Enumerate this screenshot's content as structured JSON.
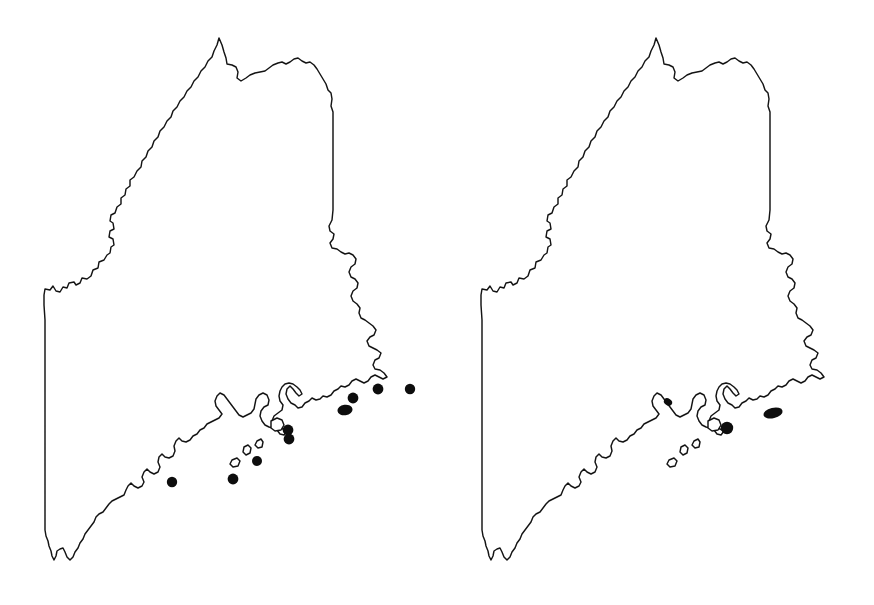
{
  "figure": {
    "panel_count": 2,
    "background_color": "#ffffff",
    "outline_color": "#141414",
    "dot_color": "#0d0d0d",
    "canvas": {
      "width": 874,
      "height": 605
    }
  },
  "panels": [
    {
      "id": "left",
      "name": "left-distribution-map",
      "region_label": "Maine",
      "origin_x": 0,
      "dot_count": 9,
      "dots": [
        {
          "label": "dot-1",
          "cx": 172,
          "cy": 482,
          "rx": 5.2,
          "ry": 5.2,
          "rot": 0
        },
        {
          "label": "dot-2",
          "cx": 233,
          "cy": 479,
          "rx": 5.4,
          "ry": 5.4,
          "rot": 0
        },
        {
          "label": "dot-3",
          "cx": 257,
          "cy": 461,
          "rx": 5.0,
          "ry": 5.0,
          "rot": 0
        },
        {
          "label": "dot-4",
          "cx": 288,
          "cy": 430,
          "rx": 5.4,
          "ry": 5.4,
          "rot": 0
        },
        {
          "label": "dot-5",
          "cx": 289,
          "cy": 439,
          "rx": 5.4,
          "ry": 5.4,
          "rot": 0
        },
        {
          "label": "dot-6",
          "cx": 345,
          "cy": 410,
          "rx": 7.6,
          "ry": 5.2,
          "rot": -8
        },
        {
          "label": "dot-7",
          "cx": 353,
          "cy": 398,
          "rx": 5.4,
          "ry": 5.4,
          "rot": 0
        },
        {
          "label": "dot-8",
          "cx": 378,
          "cy": 389,
          "rx": 5.4,
          "ry": 5.4,
          "rot": 0
        },
        {
          "label": "dot-9",
          "cx": 410,
          "cy": 389,
          "rx": 5.2,
          "ry": 5.2,
          "rot": 0
        }
      ]
    },
    {
      "id": "right",
      "name": "right-distribution-map",
      "region_label": "Maine",
      "origin_x": 437,
      "dot_count": 3,
      "dots": [
        {
          "label": "dot-1",
          "cx": 231,
          "cy": 402,
          "rx": 4.4,
          "ry": 3.4,
          "rot": 35
        },
        {
          "label": "dot-2",
          "cx": 290,
          "cy": 428,
          "rx": 6.2,
          "ry": 6.2,
          "rot": 0
        },
        {
          "label": "dot-3",
          "cx": 336,
          "cy": 413,
          "rx": 9.8,
          "ry": 5.2,
          "rot": -14
        }
      ]
    }
  ],
  "geometry": {
    "state_outline_path": "M 44 295 L 45 290 L 49 291 L 52 288 L 54 293 L 58 294 L 61 290 L 65 291 L 66 286 L 71 285 L 73 288 L 77 286 L 79 281 L 84 282 L 88 279 L 90 273 L 95 272 L 96 266 L 101 264 L 104 259 L 108 258 L 109 252 L 113 250 L 113 244 L 109 241 L 110 236 L 114 234 L 113 228 L 109 226 L 110 220 L 114 218 L 116 212 L 120 209 L 120 203 L 124 200 L 125 194 L 129 191 L 129 185 L 133 182 L 136 176 L 140 172 L 141 166 L 145 162 L 147 156 L 151 152 L 153 146 L 157 142 L 159 136 L 163 132 L 166 126 L 170 122 L 172 116 L 176 112 L 179 106 L 183 102 L 186 96 L 190 92 L 193 86 L 197 82 L 200 76 L 204 72 L 207 66 L 211 62 L 213 56 L 216 51 L 218 44 L 220 38 L 222 44 L 224 51 L 226 57 L 227 63 L 232 64 L 236 66 L 238 71 L 237 77 L 240 80 L 245 78 L 249 75 L 254 73 L 259 72 L 264 71 L 268 69 L 272 66 L 277 64 L 281 63 L 285 65 L 289 63 L 293 60 L 297 59 L 301 62 L 305 64 L 309 63 L 313 66 L 316 70 L 319 75 L 322 80 L 325 85 L 327 91 L 330 94 L 331 100 L 330 107 L 332 113 L 332 120 L 332 128 L 332 136 L 332 144 L 332 152 L 332 160 L 332 168 L 332 176 L 332 184 L 332 192 L 332 200 L 332 208 L 332 216 L 331 224 L 328 229 L 329 234 L 333 237 L 332 242 L 329 246 L 331 251 L 336 252 L 340 255 L 344 257 L 348 256 L 352 258 L 355 262 L 354 267 L 350 270 L 348 275 L 350 280 L 354 282 L 357 286 L 356 291 L 352 294 L 350 299 L 352 304 L 356 307 L 359 311 L 358 316 L 360 321 L 364 323 L 368 326 L 372 329 L 375 333 L 373 338 L 369 340 L 366 344 L 368 349 L 372 351 L 376 353 L 380 356 L 378 361 L 374 363 L 372 368 L 374 372 L 379 373 L 383 376 L 386 380 L 382 382 L 378 380 L 374 378 L 370 380 L 367 384 L 363 386 L 359 384 L 355 382 L 351 384 L 348 388 L 344 390 L 340 389 L 337 392 L 333 394 L 330 398 L 326 400 L 322 399 L 319 402 L 315 403 L 311 401 L 308 404 L 304 406 L 301 410 L 297 411 L 294 408 L 290 406 L 287 402 L 285 397 L 286 392 L 289 389 L 292 392 L 295 396 L 298 399 L 301 397 L 299 393 L 296 390 L 292 387 L 288 386 L 284 387 L 281 390 L 279 394 L 278 399 L 279 404 L 282 408 L 281 413 L 277 416 L 273 419 L 271 424 L 274 428 L 278 430 L 282 432 L 286 434 L 283 438 L 279 437 L 276 433 L 272 431 L 268 430 L 264 428 L 261 424 L 259 419 L 260 414 L 263 410 L 267 408 L 268 403 L 266 398 L 262 396 L 258 398 L 255 402 L 254 407 L 253 412 L 250 416 L 246 418 L 242 420 L 238 418 L 235 414 L 232 410 L 229 406 L 226 402 L 223 398 L 219 396 L 216 399 L 214 404 L 215 409 L 218 413 L 221 417 L 218 421 L 214 423 L 210 425 L 206 427 L 203 431 L 199 433 L 196 437 L 192 439 L 189 443 L 185 445 L 181 444 L 178 441 L 175 444 L 173 449 L 174 454 L 172 459 L 168 461 L 164 460 L 161 457 L 158 460 L 157 465 L 159 470 L 157 475 L 153 477 L 149 475 L 146 472 L 143 475 L 141 480 L 143 485 L 141 489 L 137 491 L 133 489 L 130 486 L 127 489 L 125 493 L 123 498 L 119 500 L 115 502 L 111 504 L 108 507 L 105 511 L 102 515 L 98 517 L 95 520 L 93 525 L 90 529 L 87 533 L 84 537 L 82 542 L 79 546 L 77 551 L 74 555 L 72 560 L 69 562 L 66 559 L 64 554 L 62 550 L 59 551 L 56 553 L 55 558 L 53 562 L 51 558 L 50 553 L 48 548 L 47 543 L 45 538 L 44 532 L 44 524 L 44 516 L 44 508 L 44 500 L 44 492 L 44 484 L 44 476 L 44 468 L 44 460 L 44 452 L 44 444 L 44 436 L 44 428 L 44 420 L 44 412 L 44 404 L 44 396 L 44 388 L 44 380 L 44 372 L 44 364 L 44 356 L 44 348 L 44 340 L 44 332 L 44 324 L 44 316 L 44 308 Z",
    "island_paths": [
      "M 243 446 L 247 444 L 250 447 L 249 452 L 245 454 L 242 451 Z",
      "M 231 459 L 236 457 L 239 460 L 237 465 L 232 466 L 229 463 Z",
      "M 256 440 L 260 438 L 262 441 L 261 446 L 257 447 L 254 444 Z",
      "M 270 420 L 276 417 L 281 419 L 283 424 L 280 429 L 274 430 L 270 427 Z"
    ]
  }
}
